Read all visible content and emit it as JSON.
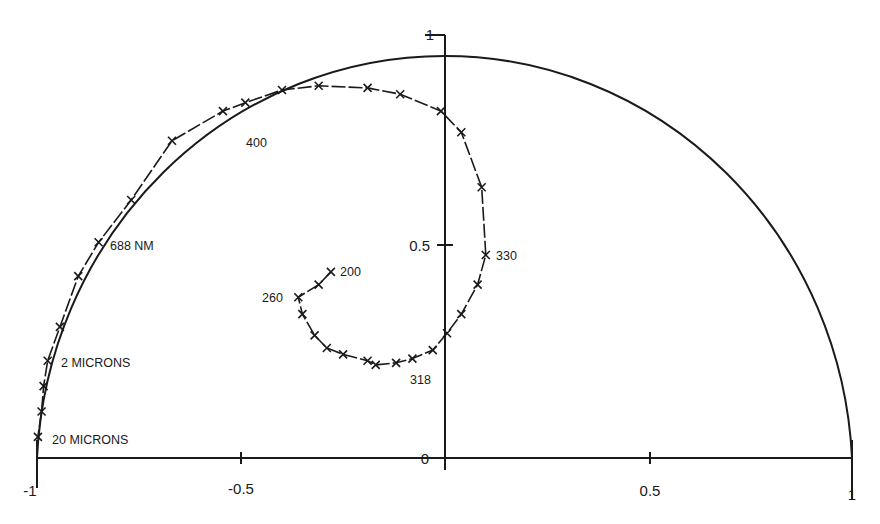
{
  "chart_data": {
    "type": "line",
    "title": "",
    "xlabel": "",
    "ylabel": "",
    "xlim": [
      -1,
      1
    ],
    "ylim": [
      0,
      1
    ],
    "grid": false,
    "legend": null,
    "x_ticks": [
      {
        "value": -1,
        "label": "-1"
      },
      {
        "value": -0.5,
        "label": "-0.5"
      },
      {
        "value": 0,
        "label": "0"
      },
      {
        "value": 0.5,
        "label": "0.5"
      },
      {
        "value": 1,
        "label": "1"
      }
    ],
    "y_ticks": [
      {
        "value": 0,
        "label": "0"
      },
      {
        "value": 0.5,
        "label": "0.5"
      },
      {
        "value": 1,
        "label": "1"
      }
    ],
    "reference_curve": {
      "name": "unit semicircle",
      "shape": "semicircle",
      "center": [
        0,
        0
      ],
      "radius": 1
    },
    "series": [
      {
        "name": "spiral",
        "marker": "x",
        "line": "solid",
        "points": [
          [
            -0.28,
            0.44
          ],
          [
            -0.31,
            0.41
          ],
          [
            -0.36,
            0.38
          ],
          [
            -0.35,
            0.34
          ],
          [
            -0.32,
            0.29
          ],
          [
            -0.29,
            0.26
          ],
          [
            -0.25,
            0.245
          ],
          [
            -0.19,
            0.23
          ],
          [
            -0.17,
            0.22
          ],
          [
            -0.12,
            0.225
          ],
          [
            -0.08,
            0.235
          ],
          [
            -0.03,
            0.255
          ],
          [
            0.005,
            0.295
          ],
          [
            0.04,
            0.34
          ],
          [
            0.08,
            0.41
          ],
          [
            0.1,
            0.48
          ],
          [
            0.09,
            0.64
          ],
          [
            0.04,
            0.77
          ],
          [
            -0.01,
            0.82
          ],
          [
            -0.11,
            0.86
          ],
          [
            -0.19,
            0.875
          ],
          [
            -0.31,
            0.88
          ],
          [
            -0.4,
            0.87
          ],
          [
            -0.49,
            0.84
          ],
          [
            -0.545,
            0.82
          ],
          [
            -0.67,
            0.75
          ],
          [
            -0.77,
            0.61
          ],
          [
            -0.85,
            0.51
          ],
          [
            -0.9,
            0.43
          ],
          [
            -0.945,
            0.31
          ],
          [
            -0.975,
            0.23
          ],
          [
            -0.985,
            0.17
          ],
          [
            -0.99,
            0.11
          ],
          [
            -0.999,
            0.05
          ]
        ]
      }
    ],
    "annotations": [
      {
        "text": "200",
        "x": -0.28,
        "y": 0.44
      },
      {
        "text": "260",
        "x": -0.36,
        "y": 0.38
      },
      {
        "text": "318",
        "x": -0.03,
        "y": 0.255
      },
      {
        "text": "330",
        "x": 0.1,
        "y": 0.48
      },
      {
        "text": "400",
        "x": -0.545,
        "y": 0.82
      },
      {
        "text": "688 NM",
        "x": -0.85,
        "y": 0.51
      },
      {
        "text": "2 MICRONS",
        "x": -0.975,
        "y": 0.23
      },
      {
        "text": "20 MICRONS",
        "x": -0.999,
        "y": 0.05
      }
    ]
  },
  "labels": {
    "xtick_neg1": "-1",
    "xtick_neg05": "-0.5",
    "xtick_0": "0",
    "xtick_05": "0.5",
    "xtick_1": "1",
    "ytick_05": "0.5",
    "ytick_1": "1",
    "ann_200": "200",
    "ann_260": "260",
    "ann_318": "318",
    "ann_330": "330",
    "ann_400": "400",
    "ann_688": "688 NM",
    "ann_2mic": "2 MICRONS",
    "ann_20mic": "20 MICRONS"
  },
  "colors": {
    "ink": "#1a1a1a",
    "background": "#ffffff"
  }
}
